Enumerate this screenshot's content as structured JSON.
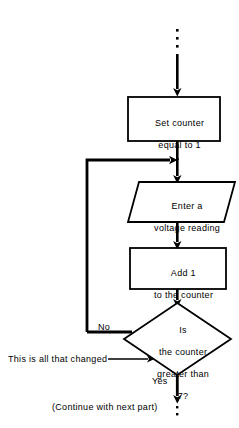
{
  "diagram": {
    "type": "flowchart",
    "nodes": [
      {
        "id": "set-counter",
        "shape": "process",
        "line1": "Set counter",
        "line2": "equal to 1"
      },
      {
        "id": "enter-voltage",
        "shape": "input-output",
        "line1": "Enter a",
        "line2": "voltage reading"
      },
      {
        "id": "add-one",
        "shape": "process",
        "line1": "Add 1",
        "line2": "to the counter"
      },
      {
        "id": "decision-counter",
        "shape": "decision",
        "line1": "Is",
        "line2": "the counter",
        "line3": "greater than",
        "line4": "7?"
      }
    ],
    "edge_labels": {
      "no": "No",
      "yes": "Yes"
    },
    "annotations": {
      "changed_note": "This is all that changed",
      "continue_note": "(Continue with next part)"
    },
    "colors": {
      "stroke": "#000000",
      "background": "#ffffff",
      "text": "#000000"
    }
  }
}
